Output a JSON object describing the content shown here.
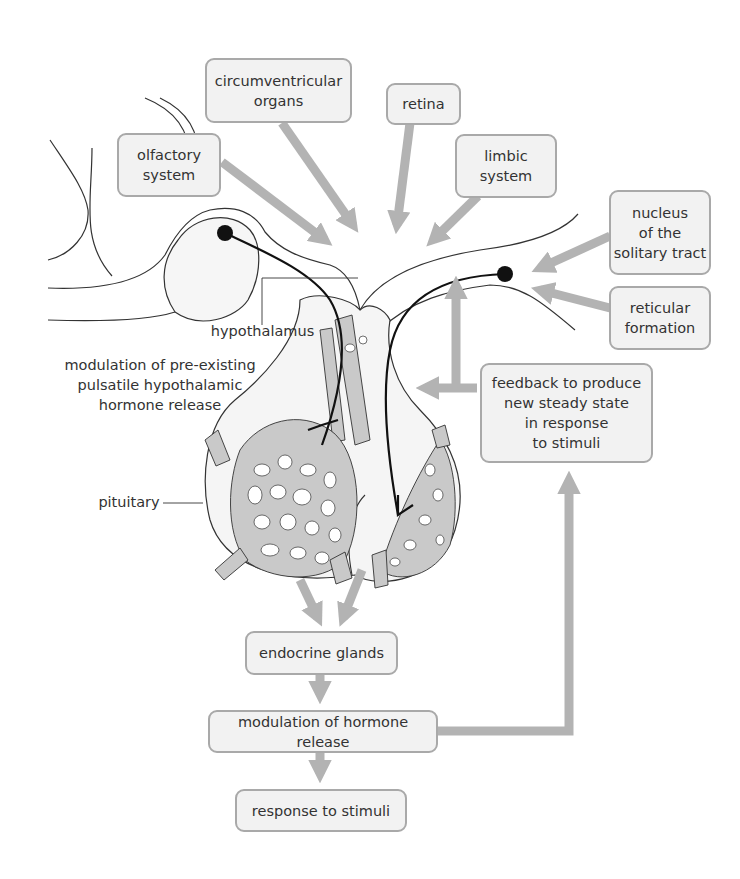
{
  "diagram": {
    "colors": {
      "box_fill": "#f2f2f2",
      "box_border": "#a9a9a9",
      "arrow": "#b3b3b3",
      "tissue": "#f4f4f4",
      "vessel": "#c8c8c8",
      "line": "#222222"
    },
    "input_boxes": [
      {
        "id": "circumventricular",
        "label": "circumventricular\norgans"
      },
      {
        "id": "retina",
        "label": "retina"
      },
      {
        "id": "olfactory",
        "label": "olfactory\nsystem"
      },
      {
        "id": "limbic",
        "label": "limbic\nsystem"
      },
      {
        "id": "nts",
        "label": "nucleus\nof the\nsolitary tract"
      },
      {
        "id": "reticular",
        "label": "reticular\nformation"
      }
    ],
    "feedback_box": {
      "label": "feedback to produce\nnew steady state\nin response\nto stimuli"
    },
    "flow_boxes": [
      {
        "id": "endocrine",
        "label": "endocrine glands"
      },
      {
        "id": "modulation",
        "label": "modulation of hormone release"
      },
      {
        "id": "response",
        "label": "response to stimuli"
      }
    ],
    "annotations": {
      "hypothalamus": "hypothalamus",
      "pituitary": "pituitary",
      "modulation_pulsatile": "modulation of pre-existing\npulsatile hypothalamic\nhormone release"
    }
  }
}
